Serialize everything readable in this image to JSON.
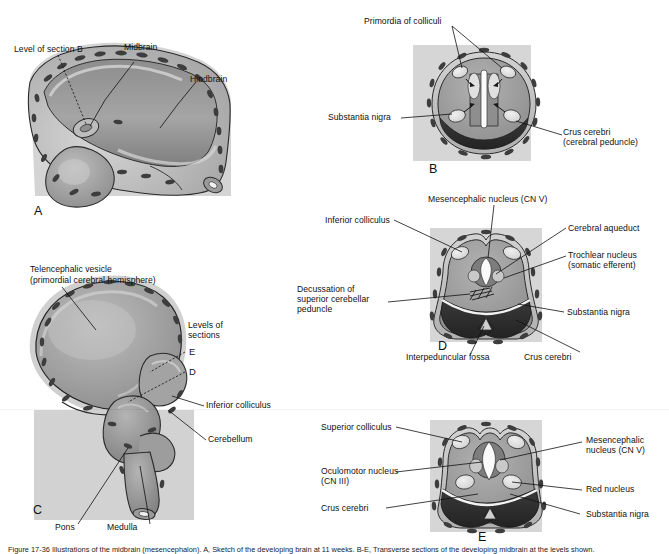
{
  "figure": {
    "caption": "Figure 17-36  Illustrations of the midbrain (mesencephalon). A, Sketch of the developing brain at 11 weeks. B-E, Transverse sections of the developing midbrain at the levels shown."
  },
  "panels": {
    "A": {
      "letter": "A",
      "labels": [
        "Level of section B",
        "Midbrain",
        "Hindbrain"
      ]
    },
    "B": {
      "letter": "B",
      "labels": [
        "Primordia of colliculi",
        "Substantia nigra",
        "Crus cerebri",
        "(cerebral peduncle)"
      ]
    },
    "C": {
      "letter": "C",
      "labels": [
        "Telencephalic vesicle",
        "(primordial cerebral hemisphere)",
        "Levels of",
        "sections",
        "E",
        "D",
        "Inferior colliculus",
        "Cerebellum",
        "Pons",
        "Medulla"
      ]
    },
    "D": {
      "letter": "D",
      "labels": [
        "Mesencephalic nucleus (CN V)",
        "Inferior colliculus",
        "Cerebral aqueduct",
        "Trochlear nucleus",
        "(somatic efferent)",
        "Decussation of",
        "superior cerebellar",
        "peduncle",
        "Substantia nigra",
        "Interpeduncular fossa",
        "Crus cerebri"
      ]
    },
    "E": {
      "letter": "E",
      "labels": [
        "Superior colliculus",
        "Mesencephalic",
        "nucleus (CN V)",
        "Oculomotor nucleus",
        "(CN III)",
        "Red nucleus",
        "Crus cerebri",
        "Substantia nigra"
      ]
    }
  },
  "label_text": {
    "a_level_section_b": "Level of section B",
    "a_midbrain": "Midbrain",
    "a_hindbrain": "Hindbrain",
    "b_primordia": "Primordia of colliculi",
    "b_substantia_nigra": "Substantia nigra",
    "b_crus_line1": "Crus cerebri",
    "b_crus_line2": "(cerebral peduncle)",
    "c_telencephalic_line1": "Telencephalic vesicle",
    "c_telencephalic_line2": "(primordial cerebral hemisphere)",
    "c_levels_line1": "Levels of",
    "c_levels_line2": "sections",
    "c_level_e": "E",
    "c_level_d": "D",
    "c_inferior_colliculus": "Inferior colliculus",
    "c_cerebellum": "Cerebellum",
    "c_pons": "Pons",
    "c_medulla": "Medulla",
    "d_mesencephalic": "Mesencephalic nucleus (CN V)",
    "d_inferior_colliculus": "Inferior colliculus",
    "d_cerebral_aqueduct": "Cerebral aqueduct",
    "d_trochlear_line1": "Trochlear nucleus",
    "d_trochlear_line2": "(somatic efferent)",
    "d_decussation_line1": "Decussation of",
    "d_decussation_line2": "superior cerebellar",
    "d_decussation_line3": "peduncle",
    "d_substantia_nigra": "Substantia nigra",
    "d_interpeduncular": "Interpeduncular fossa",
    "d_crus_cerebri": "Crus cerebri",
    "e_superior_colliculus": "Superior colliculus",
    "e_mesencephalic_line1": "Mesencephalic",
    "e_mesencephalic_line2": "nucleus (CN V)",
    "e_oculomotor_line1": "Oculomotor nucleus",
    "e_oculomotor_line2": "(CN III)",
    "e_red_nucleus": "Red nucleus",
    "e_crus_cerebri": "Crus cerebri",
    "e_substantia_nigra": "Substantia nigra",
    "letter_a": "A",
    "letter_b": "B",
    "letter_c": "C",
    "letter_d": "D",
    "letter_e": "E"
  },
  "colors": {
    "background": "#ffffff",
    "block_bg": "#d8d8d8",
    "tissue_mid": "#9a9a9a",
    "tissue_light": "#c6c6c6",
    "tissue_dark": "#6f6f6f",
    "crus_dark": "#2e2e2e",
    "nucleus_light": "#e2e2e2",
    "outline": "#111111",
    "text": "#111111"
  }
}
